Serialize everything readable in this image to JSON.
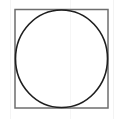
{
  "figure": {
    "title": "Circle inscribed in a square",
    "type": "geometry-diagram",
    "canvas": {
      "width": 121,
      "height": 119,
      "background_color": "#ffffff"
    },
    "shapes": [
      {
        "name": "square",
        "label": "Square",
        "x": 15,
        "y": 9.5,
        "width": 93,
        "height": 98.5,
        "stroke_color": "#6e6e6e",
        "stroke_width": 1.5,
        "fill": "none"
      },
      {
        "name": "circle",
        "label": "Inscribed circle",
        "center_x": 61.5,
        "center_y": 58.75,
        "radius_x": 46,
        "radius_y": 48.75,
        "stroke_color": "#1f1f1f",
        "stroke_width": 1.6,
        "fill": "none"
      }
    ],
    "artifacts": [
      {
        "name": "scan-line-left",
        "x": 10,
        "color": "#f4f4f4"
      },
      {
        "name": "scan-line-mid",
        "x": 70,
        "color": "#f6f6f6"
      },
      {
        "name": "scan-line-right",
        "x": 113,
        "color": "#f3f3f3"
      }
    ],
    "annotations": []
  }
}
